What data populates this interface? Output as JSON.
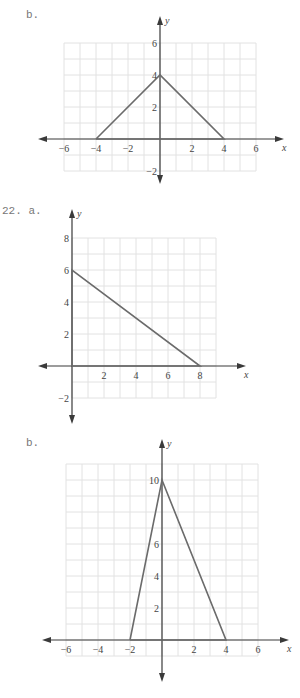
{
  "labels": {
    "p1": "b.",
    "p2": "22. a.",
    "p3": "b."
  },
  "chart_data": [
    {
      "type": "line",
      "title": "b.",
      "xlabel": "x",
      "ylabel": "y",
      "xlim": [
        -6,
        6
      ],
      "ylim": [
        -2,
        6
      ],
      "grid": true,
      "x_ticks": [
        -6,
        -4,
        -2,
        2,
        4,
        6
      ],
      "y_ticks": [
        -2,
        2,
        4,
        6
      ],
      "series": [
        {
          "name": "triangle",
          "points": [
            [
              -4,
              0
            ],
            [
              0,
              4
            ],
            [
              4,
              0
            ],
            [
              -4,
              0
            ]
          ]
        }
      ]
    },
    {
      "type": "line",
      "title": "22. a.",
      "xlabel": "x",
      "ylabel": "y",
      "xlim": [
        0,
        9
      ],
      "ylim": [
        -2,
        8
      ],
      "grid": true,
      "x_ticks": [
        2,
        4,
        6,
        8
      ],
      "y_ticks": [
        -2,
        2,
        4,
        6,
        8
      ],
      "series": [
        {
          "name": "triangle",
          "points": [
            [
              0,
              0
            ],
            [
              0,
              6
            ],
            [
              8,
              0
            ],
            [
              0,
              0
            ]
          ]
        }
      ]
    },
    {
      "type": "line",
      "title": "b.",
      "xlabel": "x",
      "ylabel": "y",
      "xlim": [
        -6,
        6
      ],
      "ylim": [
        -1,
        11
      ],
      "grid": true,
      "x_ticks": [
        -6,
        -4,
        -2,
        2,
        4,
        6
      ],
      "y_ticks": [
        2,
        4,
        6,
        10
      ],
      "series": [
        {
          "name": "triangle",
          "points": [
            [
              -2,
              0
            ],
            [
              0,
              10
            ],
            [
              4,
              0
            ],
            [
              -2,
              0
            ]
          ]
        }
      ]
    }
  ]
}
